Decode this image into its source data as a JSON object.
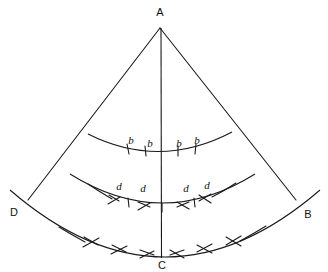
{
  "figure": {
    "background_color": "#ffffff",
    "stroke_color": "#1a1a1a",
    "canvas": {
      "width": 328,
      "height": 272
    }
  },
  "vertices": [
    {
      "id": "A",
      "label": "A",
      "x": 160,
      "y": 28,
      "label_x": 160,
      "label_y": 13,
      "role": "apex"
    },
    {
      "id": "B",
      "label": "B",
      "x": 296,
      "y": 200,
      "label_x": 308,
      "label_y": 215,
      "role": "arc-right-end"
    },
    {
      "id": "C",
      "label": "C",
      "x": 162,
      "y": 256,
      "label_x": 162,
      "label_y": 266,
      "role": "arc-midpoint"
    },
    {
      "id": "D",
      "label": "D",
      "x": 28,
      "y": 200,
      "label_x": 14,
      "label_y": 213,
      "role": "arc-left-end"
    }
  ],
  "lines": [
    {
      "name": "side-AD",
      "from": "A",
      "to": "D"
    },
    {
      "name": "side-AB",
      "from": "A",
      "to": "B"
    },
    {
      "name": "axis-AC",
      "from": "A",
      "to": "C"
    }
  ],
  "arcs": [
    {
      "name": "outer-arc-DCB",
      "from_x": 10,
      "from_y": 190,
      "to_x": 320,
      "to_y": 190,
      "radius": 232,
      "sagitta_y": 257,
      "marks": "double-chevron",
      "mark_count": 4
    },
    {
      "name": "middle-arc",
      "from_x": 70,
      "from_y": 174,
      "to_x": 255,
      "to_y": 174,
      "radius": 150,
      "sagitta_y": 203,
      "marks": "chevron-and-tick",
      "mark_count": 4,
      "segment_label": "d"
    },
    {
      "name": "upper-arc",
      "from_x": 88,
      "from_y": 134,
      "to_x": 232,
      "to_y": 132,
      "radius": 160,
      "sagitta_y": 152,
      "marks": "tick",
      "mark_count": 4,
      "segment_label": "b"
    }
  ],
  "segment_labels": {
    "upper": [
      {
        "text": "b",
        "x": 131,
        "y": 141
      },
      {
        "text": "b",
        "x": 150,
        "y": 144
      },
      {
        "text": "b",
        "x": 179,
        "y": 144
      },
      {
        "text": "b",
        "x": 197,
        "y": 141
      }
    ],
    "middle": [
      {
        "text": "d",
        "x": 119,
        "y": 187
      },
      {
        "text": "d",
        "x": 143,
        "y": 189
      },
      {
        "text": "d",
        "x": 186,
        "y": 189
      },
      {
        "text": "d",
        "x": 207,
        "y": 186
      }
    ]
  },
  "tick_marks": {
    "upper_arc": [
      {
        "x": 127,
        "y": 149
      },
      {
        "x": 145,
        "y": 151
      },
      {
        "x": 178,
        "y": 151
      },
      {
        "x": 196,
        "y": 149
      }
    ]
  }
}
